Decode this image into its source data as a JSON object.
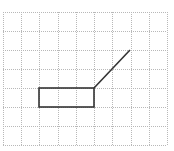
{
  "diagram": {
    "type": "grid-drawing",
    "background": "#ffffff",
    "grid": {
      "origin_x": 3,
      "origin_y": 12,
      "cols": 9,
      "rows": 7,
      "cell_w": 18.22,
      "cell_h": 19,
      "color": "#b8b8b8",
      "style": "dotted"
    },
    "shapes": {
      "rectangle": {
        "x1": 39,
        "y1": 88,
        "x2": 94,
        "y2": 107,
        "grid_cells": "cols 2-5, row 4",
        "stroke": "#333333"
      },
      "diagonal_line": {
        "x1": 94,
        "y1": 88,
        "x2": 130,
        "y2": 50,
        "stroke": "#333333"
      }
    }
  }
}
